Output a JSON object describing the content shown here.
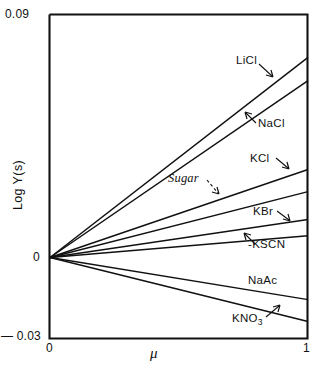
{
  "chart_data": {
    "type": "line",
    "title": "",
    "xlabel": "μ",
    "ylabel": "Log Y(s)",
    "xlim": [
      0,
      1
    ],
    "ylim": [
      -0.03,
      0.09
    ],
    "x_ticks": [
      "0",
      "1"
    ],
    "y_ticks": [
      "0.09",
      "0",
      "— 0.03"
    ],
    "grid": false,
    "legend": "inline-annotations",
    "x": [
      0,
      1
    ],
    "series": [
      {
        "name": "LiCl",
        "label": "LiCl",
        "values": [
          0,
          0.0741
        ],
        "arrow": "down-right",
        "italic": false
      },
      {
        "name": "NaCl",
        "label": "NaCl",
        "values": [
          0,
          0.0655
        ],
        "arrow": "up-left",
        "italic": false
      },
      {
        "name": "KCl",
        "label": "KCl",
        "values": [
          0,
          0.0326
        ],
        "arrow": "down-right",
        "italic": false
      },
      {
        "name": "Sugar",
        "label": "Sugar",
        "values": [
          0,
          0.0244
        ],
        "arrow": "dashed-down-right",
        "italic": true
      },
      {
        "name": "KBr",
        "label": "KBr",
        "values": [
          0,
          0.0141
        ],
        "arrow": "down-right",
        "italic": false
      },
      {
        "name": "KSCN",
        "label": "-KSCN",
        "values": [
          0,
          0.0081
        ],
        "arrow": "up-left",
        "italic": false
      },
      {
        "name": "NaAc",
        "label": "NaAc",
        "values": [
          0,
          -0.0156
        ],
        "arrow": "none",
        "italic": false
      },
      {
        "name": "KNO3",
        "label": "KNO3",
        "values": [
          0,
          -0.0237
        ],
        "arrow": "up-right",
        "italic": false
      }
    ]
  },
  "axes": {
    "y_top_label": "0.09",
    "y_zero_label": "0",
    "y_bottom_label": "— 0.03",
    "x_zero_label": "0",
    "x_one_label": "1",
    "y_title": "Log Y(s)",
    "x_title": "μ"
  },
  "annotations": {
    "licl": "LiCl",
    "nacl": "NaCl",
    "kcl": "KCl",
    "sugar": "Sugar",
    "kbr": "KBr",
    "kscn": "-KSCN",
    "naac": "NaAc",
    "kno3_base": "KNO",
    "kno3_sub": "3"
  },
  "colors": {
    "line": "#111111",
    "frame": "#111111",
    "background": "#ffffff"
  }
}
